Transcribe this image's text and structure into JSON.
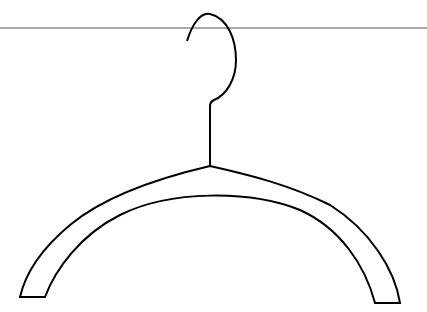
{
  "scene": {
    "description": "Line drawing of a clothes hanger hooked on a horizontal line",
    "background": "#ffffff",
    "stroke_color": "#000000",
    "rail_color": "#555555"
  }
}
